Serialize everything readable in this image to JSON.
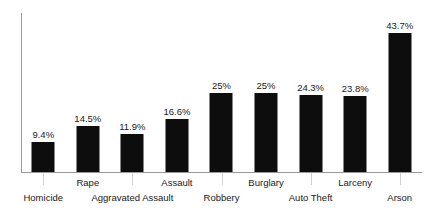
{
  "chart_data": {
    "type": "bar",
    "title": "",
    "subtitle": "",
    "xlabel": "",
    "ylabel": "",
    "categories": [
      "Homicide",
      "Rape",
      "Aggravated Assault",
      "Assault",
      "Robbery",
      "Burglary",
      "Auto Theft",
      "Larceny",
      "Arson"
    ],
    "values": [
      9.4,
      14.5,
      11.9,
      16.6,
      25,
      25,
      24.3,
      23.8,
      43.7
    ],
    "value_labels": [
      "9.4%",
      "14.5%",
      "11.9%",
      "16.6%",
      "25%",
      "25%",
      "24.3%",
      "23.8%",
      "43.7%"
    ],
    "label_rows": [
      1,
      0,
      1,
      0,
      1,
      0,
      1,
      0,
      1
    ],
    "ylim": [
      0,
      50
    ],
    "grid": false,
    "legend": false,
    "bar_color": "#0d0d0d",
    "axis_color": "#9a9a9a",
    "tick_color": "#d2d2d2",
    "background_color": "#ffffff"
  }
}
